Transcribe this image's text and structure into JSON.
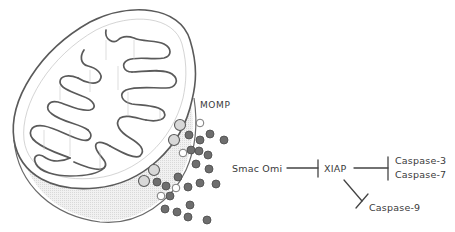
{
  "labels": {
    "momp": "MOMP",
    "smac_omi": "Smac Omi",
    "xiap": "XIAP",
    "caspase_3": "Caspase-3",
    "caspase_7": "Caspase-7",
    "caspase_9": "Caspase-9"
  },
  "colors": {
    "outline": "#5a5a5a",
    "shade": "#e6e6e6",
    "dark_dot": "#6e6e6e",
    "dark_dot_stroke": "#4a4a4a",
    "pore_fill": "#d8d8d8",
    "white_dot_stroke": "#6a6a6a",
    "text": "#3a3a3a"
  },
  "relations": [
    {
      "from": "Smac Omi",
      "to": "XIAP",
      "type": "inhibits"
    },
    {
      "from": "XIAP",
      "to": "Caspase-3",
      "type": "inhibits"
    },
    {
      "from": "XIAP",
      "to": "Caspase-7",
      "type": "inhibits"
    },
    {
      "from": "XIAP",
      "to": "Caspase-9",
      "type": "inhibits"
    }
  ],
  "pores": [
    {
      "x": 180,
      "y": 125,
      "r": 5.5
    },
    {
      "x": 174,
      "y": 140,
      "r": 5.5
    },
    {
      "x": 154,
      "y": 170,
      "r": 5.5
    },
    {
      "x": 144,
      "y": 181,
      "r": 5.5
    }
  ],
  "white_dots": [
    {
      "x": 200,
      "y": 123,
      "r": 3.8
    },
    {
      "x": 183,
      "y": 153,
      "r": 3.8
    },
    {
      "x": 176,
      "y": 188,
      "r": 3.8
    },
    {
      "x": 161,
      "y": 196,
      "r": 3.8
    }
  ],
  "dark_dots": [
    {
      "x": 189,
      "y": 135,
      "r": 4
    },
    {
      "x": 210,
      "y": 134,
      "r": 4
    },
    {
      "x": 200,
      "y": 140,
      "r": 4
    },
    {
      "x": 224,
      "y": 140,
      "r": 4
    },
    {
      "x": 191,
      "y": 150,
      "r": 4
    },
    {
      "x": 199,
      "y": 151,
      "r": 4
    },
    {
      "x": 208,
      "y": 155,
      "r": 4
    },
    {
      "x": 196,
      "y": 164,
      "r": 4
    },
    {
      "x": 209,
      "y": 169,
      "r": 4
    },
    {
      "x": 178,
      "y": 177,
      "r": 4
    },
    {
      "x": 157,
      "y": 182,
      "r": 4
    },
    {
      "x": 166,
      "y": 186,
      "r": 4
    },
    {
      "x": 188,
      "y": 187,
      "r": 4
    },
    {
      "x": 200,
      "y": 183,
      "r": 4
    },
    {
      "x": 216,
      "y": 184,
      "r": 4
    },
    {
      "x": 170,
      "y": 196,
      "r": 4
    },
    {
      "x": 190,
      "y": 205,
      "r": 4
    },
    {
      "x": 165,
      "y": 209,
      "r": 4
    },
    {
      "x": 177,
      "y": 212,
      "r": 4
    },
    {
      "x": 188,
      "y": 217,
      "r": 4
    },
    {
      "x": 207,
      "y": 220,
      "r": 4
    }
  ]
}
